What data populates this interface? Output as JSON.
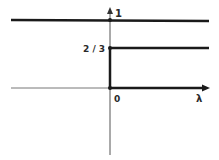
{
  "diagram": {
    "labels": {
      "y_top": "1",
      "y_mid": "2 / 3",
      "origin": "0",
      "x_axis": "λ"
    },
    "levels": [
      {
        "name": "level-one",
        "value": 1,
        "domain": "all lambda"
      },
      {
        "name": "level-two-thirds",
        "value": 0.6667,
        "domain": "lambda >= 0"
      },
      {
        "name": "level-zero",
        "value": 0,
        "domain": "lambda >= 0"
      }
    ],
    "colors": {
      "line": "#1a1a1a",
      "axis": "#555555",
      "background": "#ffffff"
    }
  }
}
